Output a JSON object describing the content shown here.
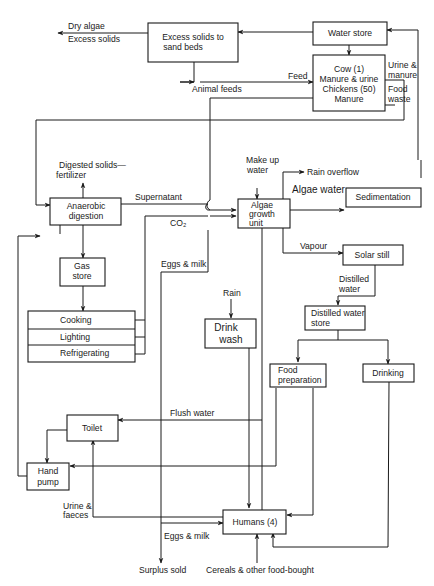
{
  "diagram": {
    "type": "flowchart",
    "colors": {
      "line": "#1a1a1a",
      "background": "#ffffff"
    },
    "nodes": {
      "excess_solids": [
        "Excess solids to",
        "sand beds"
      ],
      "water_store": "Water store",
      "cow_chickens": [
        "Cow (1)",
        "Manure & urine",
        "Chickens (50)",
        "Manure"
      ],
      "anaerobic": [
        "Anaerobic",
        "digestion"
      ],
      "algae_unit": [
        "Algae",
        "growth",
        "unit"
      ],
      "sedimentation": "Sedimentation",
      "gas_store": [
        "Gas",
        "store"
      ],
      "cooking": "Cooking",
      "lighting": "Lighting",
      "refrigerating": "Refrigerating",
      "solar_still": "Solar still",
      "drink_wash": [
        "Drink",
        "wash"
      ],
      "distilled_store": [
        "Distilled water",
        "store"
      ],
      "food_prep": [
        "Food",
        "preparation"
      ],
      "drinking": "Drinking",
      "toilet": "Toilet",
      "hand_pump": [
        "Hand",
        "pump"
      ],
      "humans": "Humans (4)"
    },
    "labels": {
      "dry_algae": "Dry algae",
      "excess_solids_out": "Excess solids",
      "animal_feeds": "Animal feeds",
      "feed": "Feed",
      "urine_manure": [
        "Urine &",
        "manure"
      ],
      "food_waste": [
        "Food",
        "waste"
      ],
      "digested_solids": [
        "Digested solids—",
        "fertilizer"
      ],
      "supernatant": "Supernatant",
      "co2": "CO₂",
      "make_up_water": [
        "Make up",
        "water"
      ],
      "rain_overflow": "Rain overflow",
      "algae_water": "Algae water",
      "vapour": "Vapour",
      "distilled_water": [
        "Distilled",
        "water"
      ],
      "eggs_milk_1": "Eggs & milk",
      "rain": "Rain",
      "flush_water": "Flush water",
      "urine_faeces": [
        "Urine &",
        "faeces"
      ],
      "eggs_milk_2": "Eggs & milk",
      "surplus_sold": "Surplus sold",
      "cereals": "Cereals & other food-bought"
    }
  }
}
